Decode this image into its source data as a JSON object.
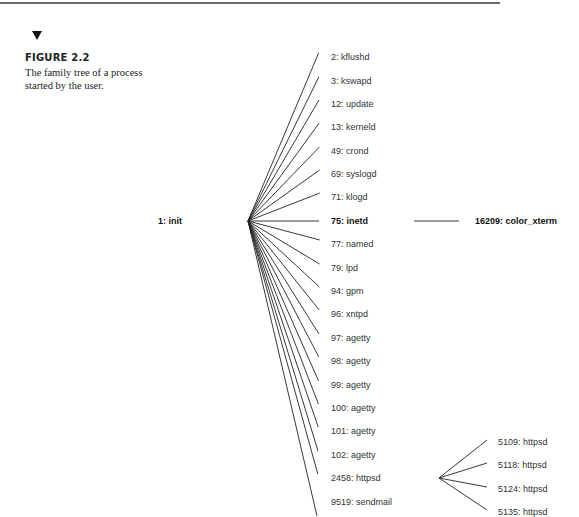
{
  "figure": {
    "label": "FIGURE 2.2",
    "caption": "The family tree of a process started by the user."
  },
  "tree": {
    "root": {
      "label": "1: init",
      "x": 248,
      "y": 221,
      "label_x": 158
    },
    "children": [
      {
        "label": "2: kflushd",
        "y": 57
      },
      {
        "label": "3: kswapd",
        "y": 81
      },
      {
        "label": "12: update",
        "y": 104
      },
      {
        "label": "13: kerneld",
        "y": 127
      },
      {
        "label": "49: crond",
        "y": 151
      },
      {
        "label": "69: syslogd",
        "y": 174
      },
      {
        "label": "71: klogd",
        "y": 197
      },
      {
        "label": "75: inetd",
        "y": 221,
        "bold": true
      },
      {
        "label": "77: named",
        "y": 244
      },
      {
        "label": "79: lpd",
        "y": 268
      },
      {
        "label": "94: gpm",
        "y": 291
      },
      {
        "label": "96: xntpd",
        "y": 314
      },
      {
        "label": "97: agetty",
        "y": 338
      },
      {
        "label": "98: agetty",
        "y": 361
      },
      {
        "label": "99: agetty",
        "y": 385
      },
      {
        "label": "100: agetty",
        "y": 408
      },
      {
        "label": "101: agetty",
        "y": 431
      },
      {
        "label": "102: agetty",
        "y": 455
      },
      {
        "label": "2458: httpsd",
        "y": 478
      },
      {
        "label": "9519: sendmail",
        "y": 502
      }
    ],
    "inetd_child": {
      "label": "16209: color_xterm",
      "y": 221
    },
    "httpsd_children": [
      {
        "label": "5109: httpsd",
        "y": 442
      },
      {
        "label": "5118: httpsd",
        "y": 465
      },
      {
        "label": "5124: httpsd",
        "y": 489
      },
      {
        "label": "5135: httpsd",
        "y": 512
      }
    ]
  }
}
